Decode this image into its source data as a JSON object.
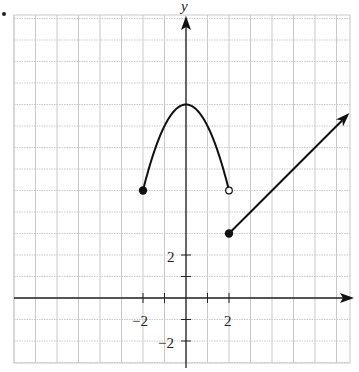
{
  "chart_data": {
    "type": "line",
    "title": "",
    "xlabel": "",
    "ylabel": "y",
    "xlim": [
      -8,
      7.5
    ],
    "ylim": [
      -3,
      13
    ],
    "grid": true,
    "x_tick_labels": [
      "-2",
      "2"
    ],
    "y_tick_labels": [
      "2",
      "-2"
    ],
    "series": [
      {
        "name": "parabola piece",
        "equation": "y = 9 - x^2",
        "domain": [
          -2,
          2
        ],
        "x": [
          -2,
          -1.5,
          -1,
          -0.5,
          0,
          0.5,
          1,
          1.5,
          2
        ],
        "y": [
          5,
          6.75,
          8,
          8.75,
          9,
          8.75,
          8,
          6.75,
          5
        ],
        "left_endpoint": {
          "x": -2,
          "y": 5,
          "type": "closed"
        },
        "right_endpoint": {
          "x": 2,
          "y": 5,
          "type": "open"
        }
      },
      {
        "name": "linear ray",
        "equation": "y = x + 1",
        "domain": [
          2,
          "inf"
        ],
        "x": [
          2,
          7.6
        ],
        "y": [
          3,
          8.6
        ],
        "left_endpoint": {
          "x": 2,
          "y": 3,
          "type": "closed"
        },
        "arrow": true
      }
    ]
  },
  "labels": {
    "y_axis": "y",
    "x_neg2": "−2",
    "x_pos2": "2",
    "y_pos2": "2",
    "y_neg2": "−2"
  }
}
